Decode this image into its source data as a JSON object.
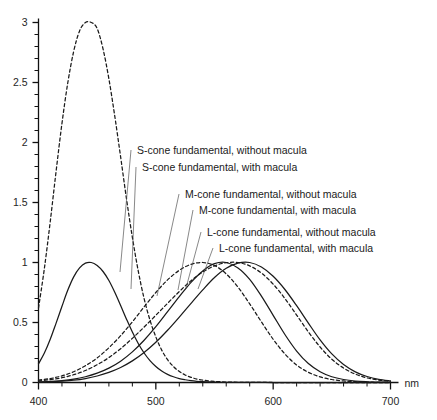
{
  "chart_data": {
    "type": "line",
    "title": "",
    "subtitle": "",
    "xlabel": "nm",
    "ylabel": "",
    "xlim": [
      400,
      700
    ],
    "ylim": [
      0,
      3.1
    ],
    "xticks": [
      400,
      500,
      600,
      700
    ],
    "xtick_labels": [
      "400",
      "500",
      "600",
      "700"
    ],
    "x_minor_tick_step": 20,
    "yticks": [
      0,
      0.5,
      1,
      1.5,
      2,
      2.5,
      3
    ],
    "ytick_labels": [
      "0",
      "0.5",
      "1",
      "1.5",
      "2",
      "2.5",
      "3"
    ],
    "y_minor_tick_step": 0.1,
    "grid": false,
    "legend_position": "inline-annotations",
    "series": [
      {
        "name": "S-cone fundamental, without macula",
        "style": "dashed",
        "color": "#1a1a1a",
        "peak_x": 445,
        "peak_y": 3.03,
        "x": [
          400,
          405,
          410,
          415,
          420,
          425,
          430,
          435,
          440,
          445,
          450,
          455,
          460,
          465,
          470,
          475,
          480,
          485,
          490,
          495,
          500,
          505,
          510,
          515,
          520,
          525,
          530,
          535,
          540,
          545,
          550,
          560,
          570,
          580,
          600,
          620,
          650,
          700
        ],
        "y": [
          0.62,
          0.95,
          1.34,
          1.76,
          2.16,
          2.5,
          2.76,
          2.93,
          3.02,
          3.03,
          2.95,
          2.78,
          2.53,
          2.22,
          1.88,
          1.53,
          1.21,
          0.93,
          0.7,
          0.52,
          0.38,
          0.27,
          0.19,
          0.133,
          0.092,
          0.063,
          0.043,
          0.029,
          0.02,
          0.013,
          0.009,
          0.004,
          0.002,
          0.001,
          0.0,
          0.0,
          0.0,
          0.0
        ]
      },
      {
        "name": "S-cone fundamental, with macula",
        "style": "solid",
        "color": "#1a1a1a",
        "peak_x": 447,
        "peak_y": 1.0,
        "x": [
          400,
          405,
          410,
          415,
          420,
          425,
          430,
          435,
          440,
          445,
          450,
          455,
          460,
          465,
          470,
          475,
          480,
          485,
          490,
          495,
          500,
          505,
          510,
          515,
          520,
          525,
          530,
          535,
          540,
          545,
          550,
          560,
          570,
          580,
          600,
          620,
          650,
          700
        ],
        "y": [
          0.155,
          0.245,
          0.36,
          0.495,
          0.635,
          0.77,
          0.88,
          0.955,
          0.995,
          1.0,
          0.975,
          0.925,
          0.85,
          0.752,
          0.642,
          0.528,
          0.42,
          0.325,
          0.246,
          0.183,
          0.134,
          0.096,
          0.068,
          0.048,
          0.033,
          0.023,
          0.015,
          0.01,
          0.007,
          0.005,
          0.003,
          0.0015,
          0.0007,
          0.0003,
          0.0,
          0.0,
          0.0,
          0.0
        ]
      },
      {
        "name": "M-cone fundamental, without macula",
        "style": "dashed",
        "color": "#1a1a1a",
        "peak_x": 540,
        "peak_y": 1.0,
        "x": [
          400,
          410,
          420,
          430,
          440,
          450,
          460,
          470,
          480,
          490,
          500,
          510,
          520,
          530,
          540,
          550,
          560,
          570,
          580,
          590,
          600,
          610,
          620,
          630,
          640,
          650,
          660,
          670,
          680,
          690,
          700
        ],
        "y": [
          0.02,
          0.033,
          0.055,
          0.09,
          0.14,
          0.205,
          0.29,
          0.39,
          0.505,
          0.63,
          0.75,
          0.855,
          0.935,
          0.985,
          1.0,
          0.975,
          0.905,
          0.795,
          0.655,
          0.505,
          0.36,
          0.238,
          0.146,
          0.085,
          0.047,
          0.025,
          0.013,
          0.0065,
          0.0032,
          0.0015,
          0.0007
        ]
      },
      {
        "name": "M-cone fundamental, with macula",
        "style": "solid",
        "color": "#1a1a1a",
        "peak_x": 543,
        "peak_y": 1.0,
        "x": [
          400,
          410,
          420,
          430,
          440,
          450,
          460,
          470,
          480,
          490,
          500,
          510,
          520,
          530,
          540,
          550,
          560,
          570,
          580,
          590,
          600,
          610,
          620,
          630,
          640,
          650,
          660,
          670,
          680,
          690,
          700
        ],
        "y": [
          0.005,
          0.009,
          0.016,
          0.028,
          0.048,
          0.078,
          0.12,
          0.178,
          0.255,
          0.352,
          0.465,
          0.59,
          0.715,
          0.835,
          0.93,
          0.99,
          1.0,
          0.955,
          0.86,
          0.72,
          0.56,
          0.4,
          0.262,
          0.158,
          0.09,
          0.048,
          0.025,
          0.012,
          0.006,
          0.003,
          0.0012
        ]
      },
      {
        "name": "L-cone fundamental, without macula",
        "style": "dashed",
        "color": "#1a1a1a",
        "peak_x": 566,
        "peak_y": 1.0,
        "x": [
          400,
          410,
          420,
          430,
          440,
          450,
          460,
          470,
          480,
          490,
          500,
          510,
          520,
          530,
          540,
          550,
          560,
          570,
          580,
          590,
          600,
          610,
          620,
          630,
          640,
          650,
          660,
          670,
          680,
          690,
          700
        ],
        "y": [
          0.014,
          0.024,
          0.04,
          0.065,
          0.1,
          0.148,
          0.208,
          0.282,
          0.368,
          0.462,
          0.56,
          0.66,
          0.758,
          0.848,
          0.92,
          0.972,
          0.998,
          1.0,
          0.972,
          0.912,
          0.82,
          0.7,
          0.562,
          0.422,
          0.296,
          0.194,
          0.12,
          0.07,
          0.038,
          0.02,
          0.01
        ]
      },
      {
        "name": "L-cone fundamental, with macula",
        "style": "solid",
        "color": "#1a1a1a",
        "peak_x": 570,
        "peak_y": 1.0,
        "x": [
          400,
          410,
          420,
          430,
          440,
          450,
          460,
          470,
          480,
          490,
          500,
          510,
          520,
          530,
          540,
          550,
          560,
          570,
          580,
          590,
          600,
          610,
          620,
          630,
          640,
          650,
          660,
          670,
          680,
          690,
          700
        ],
        "y": [
          0.003,
          0.006,
          0.011,
          0.019,
          0.033,
          0.054,
          0.084,
          0.125,
          0.18,
          0.25,
          0.335,
          0.435,
          0.545,
          0.66,
          0.772,
          0.875,
          0.952,
          0.995,
          1.0,
          0.962,
          0.885,
          0.775,
          0.64,
          0.495,
          0.355,
          0.238,
          0.15,
          0.089,
          0.05,
          0.026,
          0.013
        ]
      }
    ],
    "annotations": [
      {
        "text": "S-cone fundamental, without macula",
        "label_x": 137,
        "label_y": 154,
        "leader_to_x": 120,
        "leader_to_y": 272
      },
      {
        "text": "S-cone fundamental, with macula",
        "label_x": 142,
        "label_y": 171,
        "leader_to_x": 131,
        "leader_to_y": 289
      },
      {
        "text": "M-cone fundamental, without macula",
        "label_x": 185,
        "label_y": 198,
        "leader_to_x": 157,
        "leader_to_y": 296
      },
      {
        "text": "M-cone fundamental, with macula",
        "label_x": 199,
        "label_y": 214,
        "leader_to_x": 178,
        "leader_to_y": 290
      },
      {
        "text": "L-cone fundamental, without macula",
        "label_x": 207,
        "label_y": 236,
        "leader_to_x": 186,
        "leader_to_y": 288
      },
      {
        "text": "L-cone fundamental, with macula",
        "label_x": 219,
        "label_y": 252,
        "leader_to_x": 198,
        "leader_to_y": 289
      }
    ]
  }
}
